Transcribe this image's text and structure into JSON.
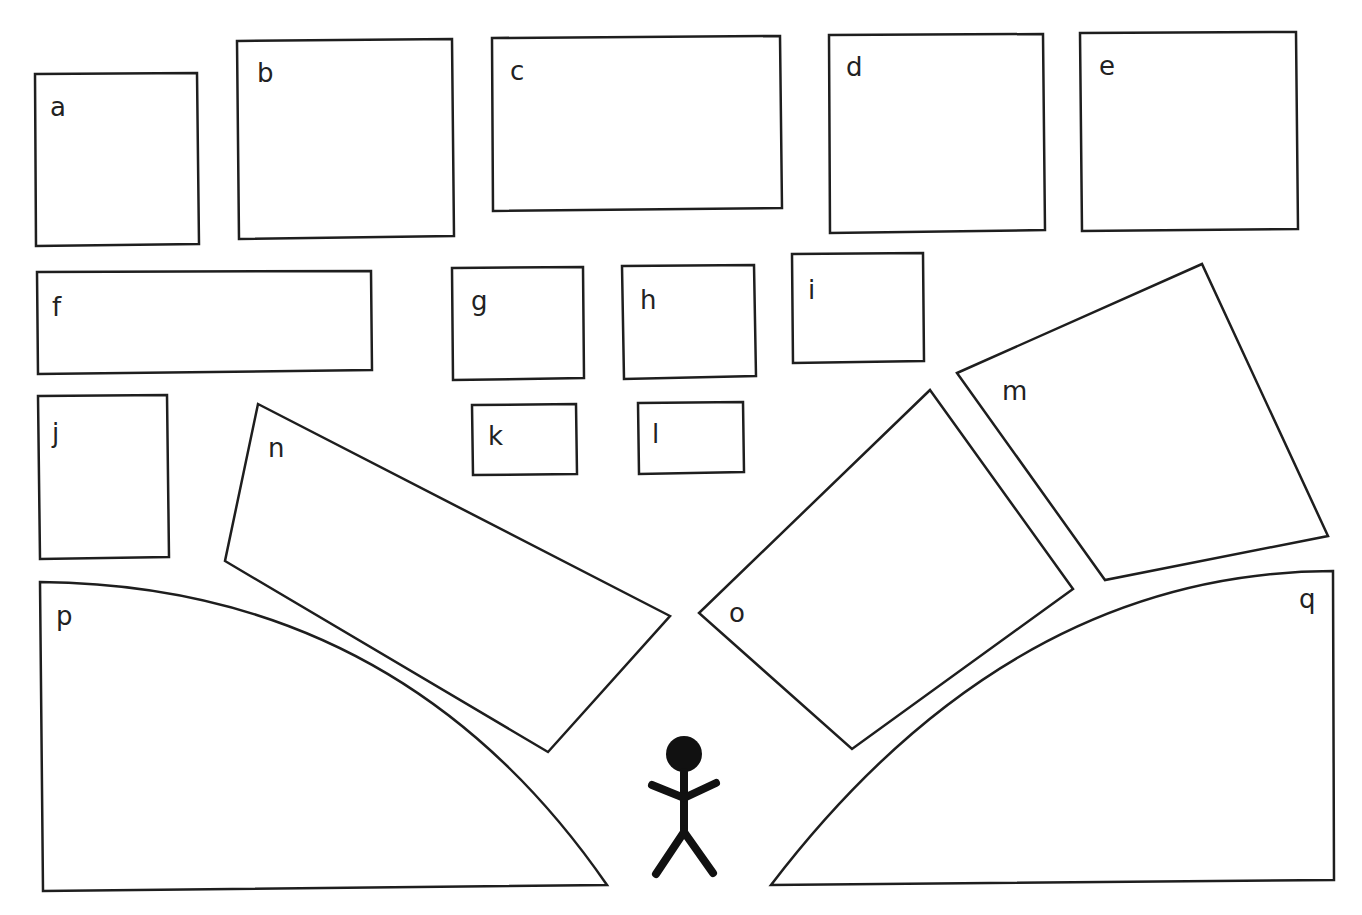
{
  "diagram": {
    "background": "#ffffff",
    "stroke_color": "#1e1e1e",
    "shapes": [
      {
        "id": "a",
        "label": "a",
        "type": "polygon",
        "points": "35,74 197,73 199,244 36,246",
        "label_pos": [
          50,
          116
        ]
      },
      {
        "id": "b",
        "label": "b",
        "type": "polygon",
        "points": "237,41 452,39 454,236 239,239",
        "label_pos": [
          257,
          82
        ]
      },
      {
        "id": "c",
        "label": "c",
        "type": "polygon",
        "points": "492,38 780,36 782,208 493,211",
        "label_pos": [
          510,
          80
        ]
      },
      {
        "id": "d",
        "label": "d",
        "type": "polygon",
        "points": "829,35 1043,34 1045,230 830,233",
        "label_pos": [
          846,
          76
        ]
      },
      {
        "id": "e",
        "label": "e",
        "type": "polygon",
        "points": "1080,33 1296,32 1298,229 1082,231",
        "label_pos": [
          1099,
          75
        ]
      },
      {
        "id": "f",
        "label": "f",
        "type": "polygon",
        "points": "37,272 371,271 372,370 38,374",
        "label_pos": [
          52,
          316
        ]
      },
      {
        "id": "g",
        "label": "g",
        "type": "polygon",
        "points": "452,268 583,267 584,378 453,380",
        "label_pos": [
          471,
          310
        ]
      },
      {
        "id": "h",
        "label": "h",
        "type": "polygon",
        "points": "622,266 754,265 756,376 624,379",
        "label_pos": [
          640,
          309
        ]
      },
      {
        "id": "i",
        "label": "i",
        "type": "polygon",
        "points": "792,254 923,253 924,361 793,363",
        "label_pos": [
          808,
          299
        ]
      },
      {
        "id": "j",
        "label": "j",
        "type": "polygon",
        "points": "38,396 167,395 169,557 40,559",
        "label_pos": [
          52,
          442
        ]
      },
      {
        "id": "k",
        "label": "k",
        "type": "polygon",
        "points": "472,405 576,404 577,474 473,475",
        "label_pos": [
          488,
          445
        ]
      },
      {
        "id": "l",
        "label": "l",
        "type": "polygon",
        "points": "638,403 743,402 744,472 639,474",
        "label_pos": [
          652,
          443
        ]
      },
      {
        "id": "m",
        "label": "m",
        "type": "polygon",
        "points": "957,373 1202,264 1328,536 1105,580",
        "label_pos": [
          1002,
          400
        ]
      },
      {
        "id": "n",
        "label": "n",
        "type": "polygon",
        "points": "258,404 670,616 548,752 225,561",
        "label_pos": [
          268,
          457
        ]
      },
      {
        "id": "o",
        "label": "o",
        "type": "polygon",
        "points": "930,390 1073,589 852,749 699,613",
        "label_pos": [
          729,
          622
        ]
      },
      {
        "id": "p",
        "label": "p",
        "type": "path",
        "d": "M 40,582 Q 400,585 607,885 L 43,891 Z",
        "label_pos": [
          56,
          625
        ]
      },
      {
        "id": "q",
        "label": "q",
        "type": "path",
        "d": "M 1333,571 Q 1010,572 771,885 L 1334,880 Z",
        "label_pos": [
          1299,
          608
        ]
      }
    ],
    "figure": {
      "name": "stick-figure",
      "head": {
        "cx": 684,
        "cy": 754,
        "r": 18
      },
      "body": "684,772 684,832",
      "arms": "652,785 684,798 716,783",
      "legs": "656,874 684,832 713,873"
    }
  }
}
